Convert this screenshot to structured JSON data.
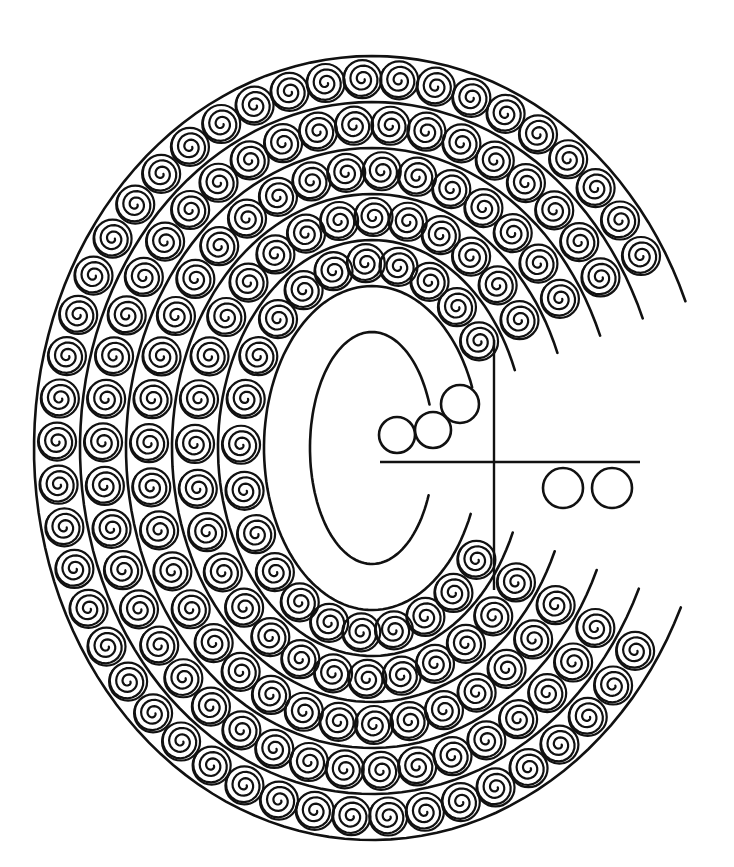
{
  "colors": {
    "stroke": "#111111",
    "background": "#ffffff"
  },
  "drawing": {
    "center": [
      372,
      448
    ],
    "outer": {
      "rx": 338,
      "ry": 392
    },
    "band_width": 46,
    "bands": 6,
    "swirl_radius": 19,
    "mouth": {
      "start_deg": -22,
      "end_deg": 24
    },
    "plain_circles": [
      {
        "cx": 397,
        "cy": 435,
        "r": 18
      },
      {
        "cx": 433,
        "cy": 430,
        "r": 18
      },
      {
        "cx": 460,
        "cy": 404,
        "r": 19
      },
      {
        "cx": 563,
        "cy": 488,
        "r": 20
      },
      {
        "cx": 612,
        "cy": 488,
        "r": 20
      }
    ],
    "cross_lines": [
      {
        "x1": 380,
        "y1": 462,
        "x2": 640,
        "y2": 462
      },
      {
        "x1": 494,
        "y1": 340,
        "x2": 494,
        "y2": 590
      }
    ]
  }
}
